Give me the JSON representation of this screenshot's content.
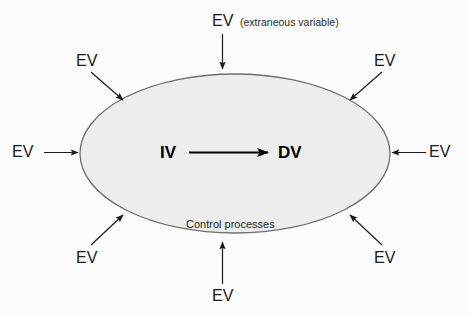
{
  "diagram": {
    "ellipse": {
      "fill_color": "#ededed",
      "stroke_color": "#6e6e6e",
      "center_x": 235,
      "center_y": 153,
      "radius_x": 155,
      "radius_y": 79,
      "inner_label": "Control  processes"
    },
    "core": {
      "independent_variable": "IV",
      "dependent_variable": "DV",
      "arrow_direction": "left-to-right",
      "arrow_color": "#000000"
    },
    "annotation": {
      "text": "(extraneous variable)"
    },
    "extraneous_variables": [
      {
        "id": "ev-top",
        "label": "EV",
        "position": "top-center",
        "arrow_direction": "down"
      },
      {
        "id": "ev-top-left",
        "label": "EV",
        "position": "top-left",
        "arrow_direction": "down-right"
      },
      {
        "id": "ev-top-right",
        "label": "EV",
        "position": "top-right",
        "arrow_direction": "down-left"
      },
      {
        "id": "ev-left",
        "label": "EV",
        "position": "middle-left",
        "arrow_direction": "right"
      },
      {
        "id": "ev-right",
        "label": "EV",
        "position": "middle-right",
        "arrow_direction": "left"
      },
      {
        "id": "ev-bot-left",
        "label": "EV",
        "position": "bottom-left",
        "arrow_direction": "up-right"
      },
      {
        "id": "ev-bot-right",
        "label": "EV",
        "position": "bottom-right",
        "arrow_direction": "up-left"
      },
      {
        "id": "ev-bottom",
        "label": "EV",
        "position": "bottom-center",
        "arrow_direction": "up"
      }
    ],
    "colors": {
      "background": "#fcfcfc",
      "text": "#1a1a1a",
      "arrow": "#1a1a1a"
    }
  }
}
